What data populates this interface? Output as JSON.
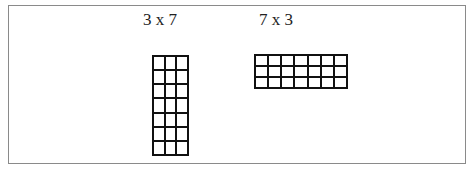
{
  "diagram": {
    "left": {
      "label": "3 x 7",
      "columns": 3,
      "rows": 7
    },
    "right": {
      "label": "7 x 3",
      "columns": 7,
      "rows": 3
    }
  }
}
